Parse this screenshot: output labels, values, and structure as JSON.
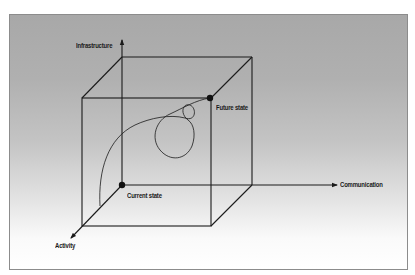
{
  "diagram": {
    "type": "3d-cube-state-space",
    "colors": {
      "line": "#1a1a1a",
      "background_top": "#a8a8a8",
      "background_bottom": "#ffffff",
      "frame_border": "#8c8c8c"
    },
    "axes": {
      "vertical": {
        "label": "Infrastructure"
      },
      "horizontal": {
        "label": "Communication"
      },
      "depth": {
        "label": "Activity"
      }
    },
    "points": {
      "current": {
        "label": "Current state"
      },
      "future": {
        "label": "Future state"
      }
    }
  }
}
